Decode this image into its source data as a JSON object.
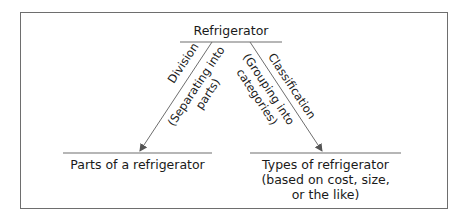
{
  "diagram": {
    "root": {
      "label": "Refrigerator"
    },
    "branches": [
      {
        "method": "Division",
        "description_lines": [
          "(Separating into",
          "parts)"
        ],
        "result_lines": [
          "Parts of a refrigerator"
        ]
      },
      {
        "method": "Classification",
        "description_lines": [
          "(Grouping into",
          "categories)"
        ],
        "result_lines": [
          "Types of refrigerator",
          "(based on cost, size,",
          "or the like)"
        ]
      }
    ]
  },
  "colors": {
    "line": "#6e6e6e",
    "text": "#1a1a1a",
    "background": "#ffffff"
  }
}
